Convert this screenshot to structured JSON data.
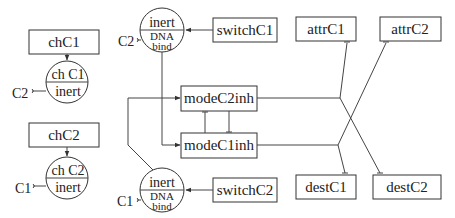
{
  "diagram": {
    "type": "gene regulatory network",
    "boxes": {
      "chC1": "chC1",
      "chC2": "chC2",
      "switchC1": "switchC1",
      "switchC2": "switchC2",
      "modeC2inh": "modeC2inh",
      "modeC1inh": "modeC1inh",
      "attrC1": "attrC1",
      "attrC2": "attrC2",
      "destC1": "destC1",
      "destC2": "destC2"
    },
    "circles": {
      "chC1_node": {
        "top": "ch C1",
        "bottom": "inert"
      },
      "chC2_node": {
        "top": "ch C2",
        "bottom": "inert"
      },
      "switchC1_node": {
        "top": "inert",
        "middle": "DNA",
        "bottom": "bind"
      },
      "switchC2_node": {
        "top": "inert",
        "middle": "DNA",
        "bottom": "bind"
      }
    },
    "inputs": {
      "chC1_input": "C2",
      "chC2_input": "C1",
      "switchC1_input": "C2",
      "switchC2_input": "C1"
    },
    "edges": [
      {
        "from": "chC1",
        "to": "chC1_node",
        "type": "activation"
      },
      {
        "from": "chC2",
        "to": "chC2_node",
        "type": "activation"
      },
      {
        "from": "switchC1",
        "to": "switchC1_node",
        "type": "activation"
      },
      {
        "from": "switchC2",
        "to": "switchC2_node",
        "type": "activation"
      },
      {
        "from": "switchC1_node",
        "to": "modeC1inh",
        "type": "activation"
      },
      {
        "from": "switchC2_node",
        "to": "modeC2inh",
        "type": "activation"
      },
      {
        "from": "modeC2inh",
        "to": "modeC1inh",
        "type": "inhibition"
      },
      {
        "from": "modeC1inh",
        "to": "modeC2inh",
        "type": "inhibition"
      },
      {
        "from": "modeC2inh",
        "to": "attrC1",
        "type": "inhibition"
      },
      {
        "from": "modeC2inh",
        "to": "destC2",
        "type": "inhibition"
      },
      {
        "from": "modeC1inh",
        "to": "attrC2",
        "type": "inhibition"
      },
      {
        "from": "modeC1inh",
        "to": "destC1",
        "type": "inhibition"
      }
    ]
  }
}
